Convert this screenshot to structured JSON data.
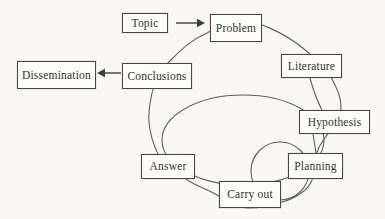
{
  "figure": {
    "type": "flow-diagram",
    "background_color": "#faf9f5",
    "line_color": "#55524a",
    "box_fill": "#fdfdfa",
    "box_border_color": "#49473f",
    "text_color": "#35322b",
    "nodes": [
      {
        "id": "topic",
        "label": "Topic"
      },
      {
        "id": "problem",
        "label": "Problem"
      },
      {
        "id": "literature",
        "label": "Literature"
      },
      {
        "id": "hypothesis",
        "label": "Hypothesis"
      },
      {
        "id": "planning",
        "label": "Planning"
      },
      {
        "id": "carry-out",
        "label": "Carry out"
      },
      {
        "id": "answer",
        "label": "Answer"
      },
      {
        "id": "conclusions",
        "label": "Conclusions"
      },
      {
        "id": "dissemination",
        "label": "Dissemination"
      }
    ],
    "edges": [
      {
        "from": "Topic",
        "to": "Problem",
        "style": "arrow"
      },
      {
        "from": "Conclusions",
        "to": "Dissemination",
        "style": "arrow"
      },
      {
        "from": "Literature",
        "to": "Hypothesis",
        "style": "line"
      },
      {
        "from": "Hypothesis",
        "to": "Planning",
        "style": "line"
      }
    ],
    "loops": [
      {
        "name": "main-research-cycle",
        "members": [
          "Problem",
          "Literature",
          "Hypothesis",
          "Planning",
          "Carry out",
          "Answer",
          "Conclusions"
        ]
      },
      {
        "name": "hypothesis-answer-loop",
        "members": [
          "Hypothesis",
          "Planning",
          "Carry out",
          "Answer"
        ]
      },
      {
        "name": "planning-carry-out-loop",
        "members": [
          "Planning",
          "Carry out"
        ]
      }
    ]
  }
}
